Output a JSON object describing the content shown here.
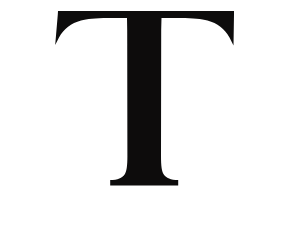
{
  "image": {
    "subject": "letter-T",
    "character": "T",
    "script": "Latin",
    "case": "uppercase",
    "style": "serif",
    "width": 290,
    "height": 225
  },
  "colors": {
    "background": "#ffffff",
    "glyph": "#0d0c0c"
  },
  "glyph": {
    "label": "T",
    "description": "Uppercase serif letter T",
    "bounds": {
      "left": 58,
      "top": 11,
      "right": 234,
      "bottom": 186
    },
    "metrics": {
      "crossbar_top_y": 11,
      "crossbar_left_x": 58,
      "crossbar_right_x": 234,
      "stem_left_x": 128,
      "stem_right_x": 160,
      "foot_left_x": 110,
      "foot_right_x": 178,
      "baseline_y": 186
    },
    "path": "M 58 11 L 234 11 L 234 14.5 L 233.5 45.5 L 229.5 37.5 C 224.5 28.8 217.5 23.4 207.5 20.6 C 201.5 18.9 193.5 18.2 180.5 18.1 L 161.5 18.1 L 161.2 30 L 161.0 156 C 161.0 166.2 161.8 171.4 163.8 174.4 C 166.2 178.0 170.6 179.7 178.2 180.1 L 178.2 185.6 L 110.2 185.6 L 110.2 180.1 C 117.8 179.7 122.2 178.0 124.6 174.4 C 126.6 171.4 127.4 166.2 127.4 156 L 127.2 30 L 127.0 18.1 L 108.0 18.1 C 95.0 18.2 87.0 18.9 81.0 20.6 C 71.0 23.4 64.0 28.8 59.0 37.5 L 55.2 45.0 L 57.8 14.5 Z"
  },
  "accessibility": {
    "alt_text": "Large black uppercase serif letter T centered on a white background"
  }
}
